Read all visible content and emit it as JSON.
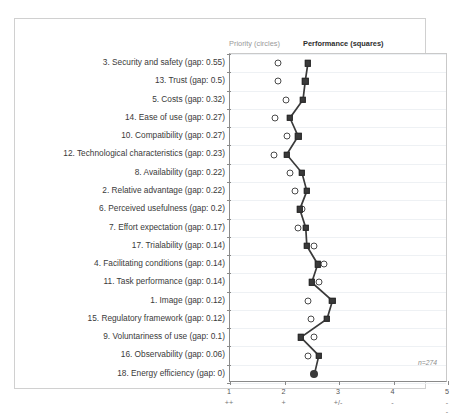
{
  "legend": {
    "priority_label": "Priority (circles)",
    "performance_label": "Performance (squares)",
    "priority_color": "#9a9a9a",
    "performance_color": "#2e2e2e"
  },
  "annotation": {
    "sample_size": "n=274"
  },
  "chart_data": {
    "type": "scatter",
    "title": "",
    "xlabel": "",
    "ylabel": "",
    "xlim": [
      1,
      5
    ],
    "grid": true,
    "legend_position": "top",
    "xticks": [
      1,
      2,
      3,
      4,
      5
    ],
    "xtick_labels": [
      "1",
      "2",
      "3",
      "4",
      "5"
    ],
    "xtick_symbols": [
      "++",
      "+",
      "+/-",
      "-",
      "--"
    ],
    "categories": [
      "3. Security and safety (gap: 0.55)",
      "13. Trust (gap: 0.5)",
      "5. Costs (gap: 0.32)",
      "14. Ease of use (gap: 0.27)",
      "10. Compatibility (gap: 0.27)",
      "12. Technological characteristics (gap: 0.23)",
      "8. Availability (gap: 0.22)",
      "2. Relative advantage (gap: 0.22)",
      "6. Perceived usefulness (gap: 0.2)",
      "7. Effort expectation (gap: 0.17)",
      "17. Trialability (gap: 0.14)",
      "4. Facilitating conditions (gap: 0.14)",
      "11. Task performance (gap: 0.14)",
      "1. Image (gap: 0.12)",
      "15. Regulatory framework (gap: 0.12)",
      "9. Voluntariness of use (gap: 0.1)",
      "16. Observability (gap: 0.06)",
      "18. Energy efficiency (gap: 0)"
    ],
    "series": [
      {
        "name": "Priority (circles)",
        "marker": "circle",
        "values": [
          1.88,
          1.88,
          2.02,
          1.83,
          2.05,
          1.81,
          2.1,
          2.19,
          2.33,
          2.25,
          2.55,
          2.73,
          2.63,
          2.44,
          2.48,
          2.55,
          2.44,
          2.55
        ]
      },
      {
        "name": "Performance (squares)",
        "marker": "square",
        "values": [
          2.43,
          2.38,
          2.34,
          2.1,
          2.25,
          2.04,
          2.32,
          2.41,
          2.28,
          2.39,
          2.41,
          2.61,
          2.5,
          2.88,
          2.78,
          2.3,
          2.63,
          2.55
        ]
      }
    ]
  }
}
